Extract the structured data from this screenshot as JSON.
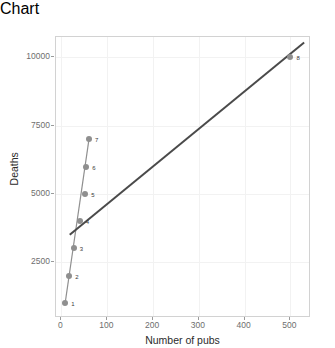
{
  "chart_data": {
    "type": "scatter",
    "title": "",
    "xlabel": "Number of pubs",
    "ylabel": "Deaths",
    "xlim": [
      -12,
      545
    ],
    "ylim": [
      450,
      10750
    ],
    "grid": true,
    "legend": false,
    "xticks": [
      0,
      100,
      200,
      300,
      400,
      500
    ],
    "xticklabels": [
      "0",
      "100",
      "200",
      "300",
      "400",
      "500"
    ],
    "yticks": [
      2500,
      5000,
      7500,
      10000
    ],
    "yticklabels": [
      "2500",
      "5000",
      "7500",
      "10000"
    ],
    "series": [
      {
        "name": "observations",
        "marker": "circle",
        "color": "#8f8f8f",
        "points": [
          {
            "label": "1",
            "x": 8,
            "y": 1000
          },
          {
            "label": "2",
            "x": 17,
            "y": 2000
          },
          {
            "label": "3",
            "x": 27,
            "y": 3000
          },
          {
            "label": "4",
            "x": 40,
            "y": 4000
          },
          {
            "label": "5",
            "x": 52,
            "y": 5000
          },
          {
            "label": "6",
            "x": 54,
            "y": 6000
          },
          {
            "label": "7",
            "x": 60,
            "y": 7000
          },
          {
            "label": "8",
            "x": 500,
            "y": 10000
          }
        ]
      }
    ],
    "lines": [
      {
        "name": "point-connector",
        "color": "#8f8f8f",
        "width": 1.2,
        "x": [
          8,
          60
        ],
        "y": [
          1000,
          7000
        ]
      },
      {
        "name": "regression-line",
        "color": "#4a4a4a",
        "width": 2.0,
        "x": [
          18,
          530
        ],
        "y": [
          3500,
          10550
        ]
      }
    ]
  },
  "axis": {
    "x_title": "Number of pubs",
    "y_title": "Deaths"
  }
}
